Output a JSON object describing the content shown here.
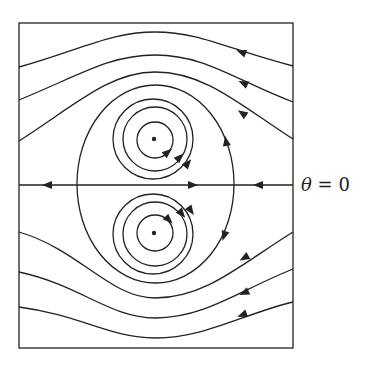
{
  "figure": {
    "type": "phase-portrait",
    "axis_label": {
      "symbol": "θ",
      "equals": "=",
      "value": "0",
      "full": "θ = 0"
    },
    "colors": {
      "stroke": "#222222",
      "background": "#ffffff"
    },
    "elements": {
      "frame": "rectangle",
      "centers": [
        "upper-vortex-center",
        "lower-vortex-center"
      ],
      "vortex_rings_per_center": 3,
      "upper_streamlines": 3,
      "lower_streamlines": 3,
      "separatrix": "oval",
      "axis_arrows": [
        "left",
        "right",
        "left"
      ]
    }
  }
}
